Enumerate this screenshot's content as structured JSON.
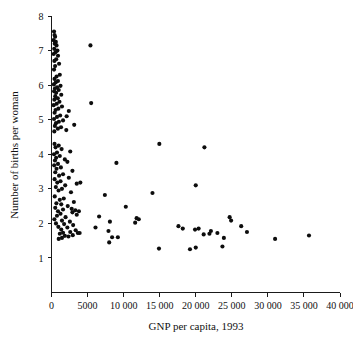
{
  "chart_data": {
    "type": "scatter",
    "title": "",
    "xlabel": "GNP per capita, 1993",
    "ylabel": "Number of births per woman",
    "xlim": [
      0,
      40000
    ],
    "ylim": [
      0,
      8
    ],
    "grid": false,
    "legend": null,
    "xticks": [
      0,
      5000,
      10000,
      15000,
      20000,
      25000,
      30000,
      35000,
      40000
    ],
    "xtick_labels": [
      "0",
      "5000",
      "10 000",
      "15 000",
      "20 000",
      "25 000",
      "30 000",
      "35 000",
      "40 000"
    ],
    "yticks": [
      1,
      2,
      3,
      4,
      5,
      6,
      7,
      8
    ],
    "ytick_labels": [
      "1",
      "2",
      "3",
      "4",
      "5",
      "6",
      "7",
      "8"
    ],
    "marker": "filled-circle",
    "marker_color": "#0d0d0d",
    "marker_size_px": 3.0,
    "points": [
      [
        350,
        7.55
      ],
      [
        420,
        7.45
      ],
      [
        500,
        7.4
      ],
      [
        300,
        7.3
      ],
      [
        600,
        7.25
      ],
      [
        450,
        7.2
      ],
      [
        700,
        7.15
      ],
      [
        380,
        7.05
      ],
      [
        820,
        7.0
      ],
      [
        550,
        6.95
      ],
      [
        300,
        6.9
      ],
      [
        900,
        6.85
      ],
      [
        650,
        6.75
      ],
      [
        400,
        6.7
      ],
      [
        1050,
        6.62
      ],
      [
        500,
        6.55
      ],
      [
        350,
        6.45
      ],
      [
        1150,
        6.3
      ],
      [
        700,
        6.25
      ],
      [
        420,
        6.18
      ],
      [
        900,
        6.12
      ],
      [
        600,
        6.08
      ],
      [
        330,
        6.02
      ],
      [
        1250,
        5.98
      ],
      [
        780,
        5.94
      ],
      [
        480,
        5.9
      ],
      [
        1000,
        5.86
      ],
      [
        360,
        5.82
      ],
      [
        650,
        5.78
      ],
      [
        1350,
        5.72
      ],
      [
        520,
        5.68
      ],
      [
        870,
        5.62
      ],
      [
        400,
        5.58
      ],
      [
        1100,
        5.52
      ],
      [
        720,
        5.46
      ],
      [
        300,
        5.42
      ],
      [
        1450,
        5.38
      ],
      [
        950,
        5.32
      ],
      [
        560,
        5.28
      ],
      [
        2400,
        5.25
      ],
      [
        430,
        5.2
      ],
      [
        1200,
        5.12
      ],
      [
        760,
        5.08
      ],
      [
        350,
        5.02
      ],
      [
        1600,
        4.98
      ],
      [
        1020,
        4.94
      ],
      [
        620,
        4.9
      ],
      [
        3150,
        4.85
      ],
      [
        470,
        4.82
      ],
      [
        1320,
        4.78
      ],
      [
        880,
        4.74
      ],
      [
        2050,
        4.7
      ],
      [
        390,
        4.66
      ],
      [
        420,
        4.3
      ],
      [
        1000,
        4.25
      ],
      [
        560,
        4.2
      ],
      [
        1400,
        4.15
      ],
      [
        2600,
        4.08
      ],
      [
        760,
        4.05
      ],
      [
        350,
        4.0
      ],
      [
        1150,
        3.95
      ],
      [
        640,
        3.9
      ],
      [
        1850,
        3.85
      ],
      [
        480,
        3.82
      ],
      [
        2200,
        3.78
      ],
      [
        900,
        3.72
      ],
      [
        370,
        3.68
      ],
      [
        1300,
        3.62
      ],
      [
        700,
        3.58
      ],
      [
        2900,
        3.52
      ],
      [
        520,
        3.48
      ],
      [
        1600,
        3.42
      ],
      [
        1050,
        3.38
      ],
      [
        2400,
        3.32
      ],
      [
        430,
        3.28
      ],
      [
        1250,
        3.22
      ],
      [
        800,
        3.18
      ],
      [
        3500,
        3.15
      ],
      [
        1900,
        3.1
      ],
      [
        600,
        3.05
      ],
      [
        1450,
        3.0
      ],
      [
        980,
        2.95
      ],
      [
        2700,
        2.9
      ],
      [
        7400,
        2.82
      ],
      [
        450,
        2.78
      ],
      [
        1700,
        2.72
      ],
      [
        1150,
        2.68
      ],
      [
        3100,
        2.62
      ],
      [
        680,
        2.58
      ],
      [
        1350,
        2.55
      ],
      [
        2250,
        2.5
      ],
      [
        10300,
        2.48
      ],
      [
        520,
        2.45
      ],
      [
        1600,
        2.4
      ],
      [
        3300,
        2.38
      ],
      [
        900,
        2.35
      ],
      [
        14000,
        2.88
      ],
      [
        2900,
        2.32
      ],
      [
        1250,
        2.28
      ],
      [
        3500,
        2.25
      ],
      [
        760,
        2.22
      ],
      [
        1950,
        2.18
      ],
      [
        6600,
        2.2
      ],
      [
        11800,
        2.15
      ],
      [
        12100,
        2.12
      ],
      [
        400,
        2.12
      ],
      [
        1450,
        2.08
      ],
      [
        2550,
        2.05
      ],
      [
        8100,
        2.05
      ],
      [
        11600,
        2.02
      ],
      [
        620,
        2.0
      ],
      [
        1750,
        1.98
      ],
      [
        3000,
        1.95
      ],
      [
        17600,
        1.92
      ],
      [
        950,
        1.9
      ],
      [
        2200,
        1.88
      ],
      [
        18200,
        1.85
      ],
      [
        6100,
        1.88
      ],
      [
        1350,
        1.82
      ],
      [
        3350,
        1.8
      ],
      [
        19900,
        1.82
      ],
      [
        20400,
        1.85
      ],
      [
        7900,
        1.78
      ],
      [
        2600,
        1.75
      ],
      [
        1600,
        1.73
      ],
      [
        22100,
        1.78
      ],
      [
        24700,
        2.18
      ],
      [
        24900,
        2.08
      ],
      [
        3650,
        1.72
      ],
      [
        1150,
        1.7
      ],
      [
        21100,
        1.68
      ],
      [
        21900,
        1.7
      ],
      [
        26300,
        1.92
      ],
      [
        2950,
        1.66
      ],
      [
        1850,
        1.64
      ],
      [
        23000,
        1.72
      ],
      [
        27100,
        1.75
      ],
      [
        8400,
        1.6
      ],
      [
        31000,
        1.55
      ],
      [
        35700,
        1.65
      ],
      [
        2350,
        1.62
      ],
      [
        1450,
        1.58
      ],
      [
        9200,
        1.6
      ],
      [
        23900,
        1.58
      ],
      [
        3900,
        1.72
      ],
      [
        1000,
        1.55
      ],
      [
        14900,
        1.27
      ],
      [
        19200,
        1.25
      ],
      [
        20000,
        1.3
      ],
      [
        23700,
        1.33
      ],
      [
        8000,
        1.45
      ],
      [
        5400,
        7.15
      ],
      [
        5500,
        5.48
      ],
      [
        14950,
        4.3
      ],
      [
        21200,
        4.2
      ],
      [
        20000,
        3.1
      ],
      [
        9000,
        3.75
      ],
      [
        2100,
        5.1
      ],
      [
        2800,
        2.42
      ],
      [
        3800,
        2.35
      ],
      [
        4000,
        3.18
      ]
    ]
  },
  "figure": {
    "background_color": "#ffffff",
    "axis_color": "#1a1a1a",
    "text_color": "#111111"
  }
}
